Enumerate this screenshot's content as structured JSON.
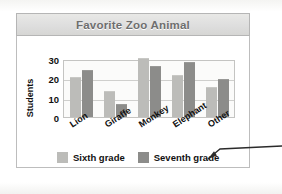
{
  "chart_data": {
    "type": "bar",
    "title": "Favorite Zoo Animal",
    "xlabel": "",
    "ylabel": "Students",
    "categories": [
      "Lion",
      "Giraffe",
      "Monkey",
      "Elephant",
      "Other"
    ],
    "series": [
      {
        "name": "Sixth grade",
        "color": "#bcbcb9",
        "values": [
          20,
          13,
          30,
          21,
          15
        ]
      },
      {
        "name": "Seventh grade",
        "color": "#8c8c8a",
        "values": [
          24,
          6,
          26,
          28,
          19
        ]
      }
    ],
    "ylim": [
      0,
      30
    ],
    "yticks": [
      30,
      20,
      10,
      0
    ],
    "grid": true,
    "legend_position": "bottom"
  },
  "annotation": {
    "arrow_name": "pointer-arrow-to-legend"
  },
  "colors": {
    "title_text": "#6e6e6e",
    "title_bar": "#dedede",
    "axis_text": "#111111",
    "plot_background": "#fbfbfa",
    "gridline": "#cfcfcd",
    "card_border": "#bdbdbd"
  }
}
